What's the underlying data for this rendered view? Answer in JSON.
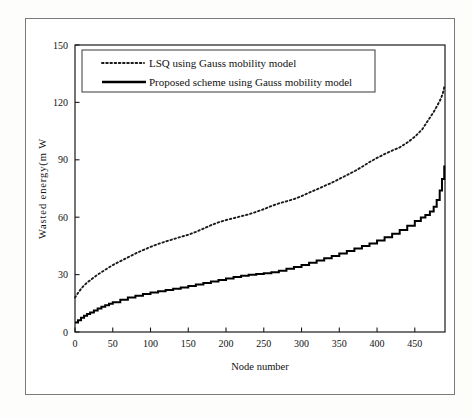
{
  "figure": {
    "background_color": "#ffffff",
    "frame_color": "#7b7b7b",
    "axis_color": "#1a1a1a"
  },
  "chart_data": {
    "type": "line",
    "title": "",
    "xlabel": "Node number",
    "ylabel": "Wasted energy(m W",
    "xlim": [
      0,
      490
    ],
    "ylim": [
      0,
      150
    ],
    "xticks": [
      0,
      50,
      100,
      150,
      200,
      250,
      300,
      350,
      400,
      450
    ],
    "xticklabels": [
      "0",
      "50",
      "100",
      "150",
      "200",
      "250",
      "300",
      "350",
      "400",
      "450"
    ],
    "yticks": [
      0,
      30,
      60,
      90,
      120,
      150
    ],
    "yticklabels": [
      "0",
      "30",
      "60",
      "90",
      "120",
      "150"
    ],
    "grid": false,
    "legend_position": "upper-left-inside",
    "series": [
      {
        "name": "LSQ using Gauss mobility model",
        "style": "dotted",
        "color": "#1a1a1a",
        "x": [
          0,
          5,
          10,
          15,
          20,
          25,
          30,
          40,
          50,
          60,
          70,
          80,
          90,
          100,
          110,
          120,
          130,
          140,
          150,
          160,
          170,
          180,
          190,
          200,
          210,
          220,
          230,
          240,
          250,
          260,
          270,
          280,
          290,
          300,
          310,
          320,
          330,
          340,
          350,
          360,
          370,
          380,
          390,
          400,
          410,
          420,
          430,
          440,
          450,
          460,
          465,
          470,
          475,
          480,
          484,
          487,
          489
        ],
        "values": [
          18,
          21,
          23.5,
          25.5,
          27,
          28.5,
          30,
          32.5,
          35,
          37,
          39,
          41,
          42.8,
          44.5,
          46,
          47.3,
          48.5,
          49.7,
          50.8,
          52.3,
          54,
          55.8,
          57.3,
          58.5,
          59.5,
          60.5,
          61.5,
          62.8,
          64.2,
          65.8,
          67.2,
          68.3,
          69.5,
          71,
          72.8,
          74.5,
          76.3,
          78,
          80,
          82,
          84,
          86.3,
          88.8,
          91,
          93,
          94.8,
          96.5,
          99,
          102,
          106,
          109,
          112,
          115,
          118.5,
          121.5,
          124.5,
          128
        ]
      },
      {
        "name": "Proposed scheme using Gauss mobility model",
        "style": "solid-step",
        "color": "#000000",
        "x": [
          0,
          4,
          8,
          12,
          16,
          20,
          25,
          30,
          35,
          40,
          45,
          50,
          60,
          70,
          80,
          90,
          100,
          110,
          120,
          130,
          140,
          150,
          160,
          170,
          180,
          190,
          200,
          210,
          220,
          230,
          240,
          250,
          260,
          270,
          280,
          290,
          300,
          310,
          320,
          330,
          340,
          350,
          360,
          370,
          380,
          390,
          400,
          410,
          420,
          430,
          440,
          450,
          458,
          464,
          470,
          475,
          479,
          483,
          486,
          489
        ],
        "values": [
          5,
          6.2,
          7.5,
          8.5,
          9.4,
          10.2,
          11.3,
          12.3,
          13.2,
          14,
          14.8,
          15.5,
          16.8,
          18,
          19,
          19.8,
          20.6,
          21.3,
          22,
          22.6,
          23.3,
          24,
          24.8,
          25.6,
          26.4,
          27.2,
          28,
          28.7,
          29.4,
          29.9,
          30.3,
          30.7,
          31.2,
          32,
          33,
          34,
          35,
          36.2,
          37.4,
          38.5,
          39.7,
          41,
          42.3,
          43.6,
          45,
          46.3,
          47.8,
          49.5,
          51.3,
          53.3,
          55.5,
          58,
          59.8,
          61.2,
          63,
          65.5,
          69,
          74,
          80,
          87
        ]
      }
    ]
  },
  "legend": {
    "entries": [
      {
        "label": "LSQ using Gauss mobility model",
        "style": "dotted"
      },
      {
        "label": "Proposed scheme using Gauss mobility model",
        "style": "solid"
      }
    ]
  }
}
